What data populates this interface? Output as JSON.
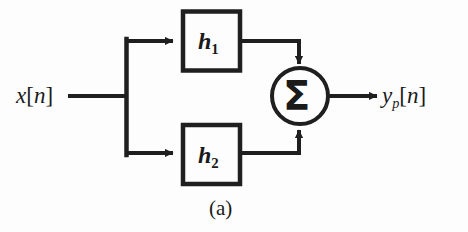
{
  "figure": {
    "caption": "(a)",
    "background_color": "#fdfdfd",
    "line_color": "#1f1f1f",
    "text_color": "#1a1a1a"
  },
  "signals": {
    "input": {
      "base": "x",
      "bracket_open": "[",
      "index": "n",
      "bracket_close": "]",
      "full": "x[n]"
    },
    "output": {
      "base": "y",
      "subscript": "p",
      "bracket_open": "[",
      "index": "n",
      "bracket_close": "]",
      "full": "y_p[n]"
    }
  },
  "blocks": [
    {
      "id": "h1",
      "base": "h",
      "subscript": "1",
      "full": "h1",
      "branch": "top"
    },
    {
      "id": "h2",
      "base": "h",
      "subscript": "2",
      "full": "h2",
      "branch": "bottom"
    }
  ],
  "adder": {
    "symbol": "Σ",
    "name": "summation",
    "inputs": 2,
    "outputs": 1
  },
  "connections": [
    {
      "from": "input",
      "to": "branch-node",
      "style": "line"
    },
    {
      "from": "branch-node",
      "to": "h1",
      "style": "arrow"
    },
    {
      "from": "branch-node",
      "to": "h2",
      "style": "arrow"
    },
    {
      "from": "h1",
      "to": "adder",
      "style": "arrow"
    },
    {
      "from": "h2",
      "to": "adder",
      "style": "arrow"
    },
    {
      "from": "adder",
      "to": "output",
      "style": "arrow"
    }
  ]
}
